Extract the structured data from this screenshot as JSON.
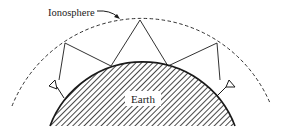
{
  "diagram": {
    "type": "skywave-propagation",
    "labels": {
      "ionosphere": "Ionosphere",
      "earth": "Earth"
    },
    "colors": {
      "stroke": "#1a1a1a",
      "background": "#ffffff",
      "label_bg": "#ffffff"
    },
    "elements": {
      "antennas": [
        "left-transmitter",
        "right-receiver"
      ],
      "reflection_points": 3,
      "ground_bounces": 2
    }
  }
}
